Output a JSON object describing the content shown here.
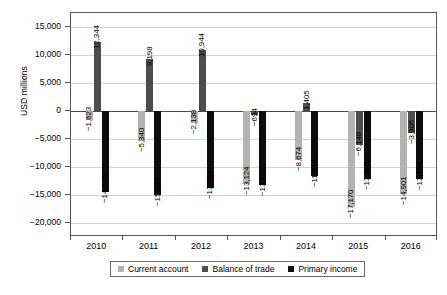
{
  "chart_data": {
    "type": "bar",
    "title": "",
    "xlabel": "",
    "ylabel": "USD millions",
    "categories": [
      "2010",
      "2011",
      "2012",
      "2013",
      "2014",
      "2015",
      "2016"
    ],
    "ylim": [
      -22500,
      17500
    ],
    "yticks": [
      15000,
      10000,
      5000,
      0,
      -5000,
      -10000,
      -15000,
      -20000
    ],
    "ytick_labels": [
      "15,000",
      "10,000",
      "5,000",
      "0",
      "−5,000",
      "−10,000",
      "−15,000",
      "−20,000"
    ],
    "grid": true,
    "legend_position": "bottom",
    "series": [
      {
        "name": "Current account",
        "color": "#b3b3b3",
        "values": [
          -1623,
          -5340,
          -2138,
          -13124,
          -8674,
          -17170,
          -14901
        ],
        "labels": [
          "−1,623",
          "−5,340",
          "−2,138",
          "−13,124",
          "−8,674",
          "−17,170",
          "−14,901"
        ]
      },
      {
        "name": "Balance of trade",
        "color": "#4d4d4d",
        "values": [
          12344,
          9198,
          10944,
          -694,
          1405,
          -6148,
          -3905
        ],
        "labels": [
          "12,344",
          "9,198",
          "10,944",
          "−694",
          "1,405",
          "−6,148",
          "−3,905"
        ]
      },
      {
        "name": "Primary income",
        "color": "#0d0d0d",
        "values": [
          -14548,
          -15073,
          -13754,
          -13165,
          -11614,
          -12105,
          -12152
        ],
        "labels": [
          "−14,548",
          "−15,073",
          "−13,754",
          "−13,165",
          "−11,614",
          "−12,105",
          "−12,152"
        ]
      }
    ]
  },
  "axis": {
    "y_title": "USD millions"
  },
  "legend": {
    "items": [
      {
        "label": "Current account",
        "color": "#b3b3b3"
      },
      {
        "label": "Balance of trade",
        "color": "#4d4d4d"
      },
      {
        "label": "Primary income",
        "color": "#0d0d0d"
      }
    ]
  }
}
